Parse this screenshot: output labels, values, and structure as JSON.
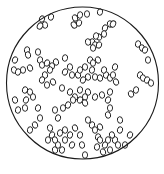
{
  "figure": {
    "type": "microscope-field-view",
    "stroke_color": "#1a1a1a",
    "background_color": "#ffffff",
    "field": {
      "cx": 82.5,
      "cy": 83,
      "r": 76
    },
    "cell_size": {
      "rx": 2.6,
      "ry": 3.3
    },
    "cells": [
      [
        42,
        19,
        20
      ],
      [
        45,
        25,
        -10
      ],
      [
        51,
        17,
        15
      ],
      [
        40,
        26,
        30
      ],
      [
        75,
        18,
        -20
      ],
      [
        80,
        15,
        10
      ],
      [
        87,
        14,
        0
      ],
      [
        79,
        23,
        20
      ],
      [
        74,
        25,
        -30
      ],
      [
        100,
        12,
        10
      ],
      [
        105,
        28,
        20
      ],
      [
        110,
        24,
        -15
      ],
      [
        113,
        24,
        25
      ],
      [
        104,
        34,
        0
      ],
      [
        99,
        37,
        -20
      ],
      [
        96,
        36,
        10
      ],
      [
        92,
        42,
        15
      ],
      [
        88,
        42,
        -10
      ],
      [
        95,
        45,
        0
      ],
      [
        99,
        45,
        20
      ],
      [
        93,
        48,
        -5
      ],
      [
        138,
        44,
        10
      ],
      [
        142,
        48,
        -15
      ],
      [
        145,
        50,
        20
      ],
      [
        148,
        60,
        0
      ],
      [
        140,
        75,
        15
      ],
      [
        143,
        78,
        -10
      ],
      [
        147,
        80,
        20
      ],
      [
        151,
        83,
        -5
      ],
      [
        136,
        90,
        10
      ],
      [
        131,
        94,
        -20
      ],
      [
        27,
        50,
        10
      ],
      [
        28,
        55,
        -15
      ],
      [
        38,
        52,
        0
      ],
      [
        15,
        60,
        20
      ],
      [
        14,
        70,
        -10
      ],
      [
        18,
        72,
        15
      ],
      [
        23,
        70,
        0
      ],
      [
        30,
        68,
        -20
      ],
      [
        40,
        60,
        10
      ],
      [
        42,
        65,
        -5
      ],
      [
        47,
        63,
        20
      ],
      [
        52,
        66,
        0
      ],
      [
        56,
        62,
        -15
      ],
      [
        50,
        70,
        10
      ],
      [
        45,
        75,
        -10
      ],
      [
        42,
        80,
        15
      ],
      [
        47,
        85,
        0
      ],
      [
        53,
        82,
        -20
      ],
      [
        65,
        58,
        10
      ],
      [
        70,
        67,
        -10
      ],
      [
        65,
        72,
        20
      ],
      [
        72,
        75,
        0
      ],
      [
        78,
        75,
        -15
      ],
      [
        80,
        70,
        10
      ],
      [
        85,
        67,
        -5
      ],
      [
        90,
        60,
        15
      ],
      [
        93,
        63,
        0
      ],
      [
        98,
        60,
        -20
      ],
      [
        92,
        70,
        10
      ],
      [
        88,
        77,
        -10
      ],
      [
        83,
        80,
        20
      ],
      [
        95,
        77,
        0
      ],
      [
        100,
        78,
        -15
      ],
      [
        106,
        75,
        10
      ],
      [
        110,
        78,
        -5
      ],
      [
        115,
        67,
        15
      ],
      [
        113,
        75,
        0
      ],
      [
        116,
        82,
        -20
      ],
      [
        104,
        70,
        10
      ],
      [
        62,
        88,
        0
      ],
      [
        70,
        92,
        15
      ],
      [
        75,
        97,
        -10
      ],
      [
        80,
        100,
        20
      ],
      [
        85,
        97,
        0
      ],
      [
        88,
        92,
        -15
      ],
      [
        80,
        90,
        10
      ],
      [
        73,
        100,
        -5
      ],
      [
        68,
        105,
        15
      ],
      [
        63,
        108,
        0
      ],
      [
        85,
        103,
        -20
      ],
      [
        95,
        97,
        10
      ],
      [
        102,
        95,
        -10
      ],
      [
        108,
        100,
        20
      ],
      [
        110,
        108,
        0
      ],
      [
        108,
        115,
        -15
      ],
      [
        110,
        92,
        10
      ],
      [
        25,
        90,
        15
      ],
      [
        30,
        92,
        -10
      ],
      [
        26,
        100,
        20
      ],
      [
        33,
        97,
        0
      ],
      [
        15,
        100,
        -15
      ],
      [
        18,
        110,
        10
      ],
      [
        25,
        108,
        -5
      ],
      [
        38,
        108,
        15
      ],
      [
        40,
        118,
        0
      ],
      [
        35,
        125,
        -20
      ],
      [
        30,
        130,
        10
      ],
      [
        55,
        110,
        0
      ],
      [
        58,
        118,
        15
      ],
      [
        50,
        128,
        -10
      ],
      [
        52,
        135,
        20
      ],
      [
        48,
        140,
        0
      ],
      [
        55,
        140,
        -15
      ],
      [
        60,
        133,
        10
      ],
      [
        65,
        130,
        -5
      ],
      [
        70,
        135,
        15
      ],
      [
        65,
        140,
        0
      ],
      [
        75,
        128,
        -20
      ],
      [
        80,
        135,
        10
      ],
      [
        82,
        145,
        -10
      ],
      [
        72,
        145,
        20
      ],
      [
        58,
        145,
        0
      ],
      [
        55,
        150,
        -15
      ],
      [
        62,
        150,
        10
      ],
      [
        88,
        120,
        -5
      ],
      [
        92,
        125,
        15
      ],
      [
        95,
        130,
        0
      ],
      [
        100,
        127,
        -20
      ],
      [
        98,
        137,
        10
      ],
      [
        100,
        140,
        -10
      ],
      [
        105,
        145,
        20
      ],
      [
        108,
        140,
        0
      ],
      [
        112,
        135,
        -15
      ],
      [
        115,
        140,
        10
      ],
      [
        118,
        145,
        -5
      ],
      [
        120,
        130,
        15
      ],
      [
        110,
        150,
        0
      ],
      [
        103,
        152,
        -20
      ],
      [
        97,
        147,
        10
      ],
      [
        85,
        155,
        0
      ],
      [
        120,
        120,
        -10
      ],
      [
        130,
        135,
        20
      ],
      [
        125,
        145,
        0
      ]
    ]
  },
  "caption": {
    "text": ""
  }
}
